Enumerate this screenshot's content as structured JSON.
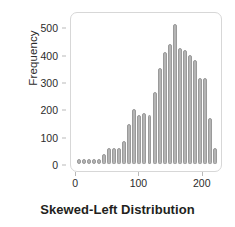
{
  "chart_data": {
    "type": "bar",
    "title": "Skewed-Left Distribution",
    "xlabel": "Skewed-Left Distribution",
    "ylabel": "Frequency",
    "grid": false,
    "legend": false,
    "xlim": [
      -8,
      232
    ],
    "ylim": [
      0,
      530
    ],
    "xticks": [
      0,
      100,
      200
    ],
    "xtick_labels": [
      "0",
      "100",
      "200"
    ],
    "yticks": [
      0,
      100,
      200,
      300,
      400,
      500
    ],
    "ytick_labels": [
      "0",
      "100",
      "200",
      "300",
      "400",
      "500"
    ],
    "bin_width": 8,
    "bar_color": "#b4b4b4",
    "bar_edge_color": "#9a9a9a",
    "categories": [
      "4",
      "12",
      "20",
      "28",
      "36",
      "44",
      "52",
      "60",
      "68",
      "76",
      "84",
      "92",
      "100",
      "108",
      "116",
      "124",
      "132",
      "140",
      "148",
      "156",
      "164",
      "172",
      "180",
      "188",
      "196",
      "204",
      "212",
      "220"
    ],
    "values": [
      6,
      5,
      5,
      5,
      10,
      35,
      57,
      57,
      60,
      85,
      145,
      200,
      180,
      185,
      180,
      265,
      350,
      410,
      440,
      510,
      425,
      415,
      400,
      380,
      315,
      315,
      170,
      60
    ]
  },
  "axis": {
    "ylabel": "Frequency",
    "ytick_labels": [
      "500",
      "400",
      "300",
      "200",
      "100",
      "0"
    ],
    "xtick_labels": [
      "0",
      "100",
      "200"
    ]
  },
  "footer": {
    "title": "Skewed-Left Distribution"
  }
}
